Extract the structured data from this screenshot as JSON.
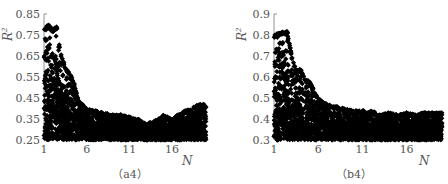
{
  "chart_data": [
    {
      "id": "a4",
      "type": "scatter",
      "title": "",
      "caption": "（a4）",
      "xlabel": "N",
      "ylabel": "R²",
      "xlim": [
        1,
        20
      ],
      "ylim": [
        0.25,
        0.85
      ],
      "xticks": [
        1,
        6,
        11,
        16
      ],
      "xtick_labels": [
        "1",
        "6",
        "11",
        "16"
      ],
      "yticks": [
        0.25,
        0.35,
        0.45,
        0.55,
        0.65,
        0.75,
        0.85
      ],
      "ytick_labels": [
        "0.25",
        "0.35",
        "0.45",
        "0.55",
        "0.65",
        "0.75",
        "0.85"
      ],
      "grid": false,
      "legend": null,
      "marker": "diamond",
      "color": "#000000",
      "upper_envelope": {
        "x": [
          1,
          1.5,
          2,
          2.5,
          3,
          3.5,
          4,
          4.5,
          5,
          6,
          7,
          8,
          9,
          10,
          11,
          12,
          13,
          14,
          15,
          16,
          17,
          18,
          19,
          20
        ],
        "y": [
          0.78,
          0.8,
          0.78,
          0.79,
          0.66,
          0.6,
          0.57,
          0.53,
          0.44,
          0.4,
          0.39,
          0.38,
          0.37,
          0.37,
          0.36,
          0.35,
          0.33,
          0.34,
          0.37,
          0.35,
          0.38,
          0.4,
          0.42,
          0.42
        ]
      },
      "lower_bound": 0.25
    },
    {
      "id": "b4",
      "type": "scatter",
      "title": "",
      "caption": "（b4）",
      "xlabel": "N",
      "ylabel": "R²",
      "xlim": [
        1,
        20
      ],
      "ylim": [
        0.3,
        0.9
      ],
      "xticks": [
        1,
        6,
        11,
        16
      ],
      "xtick_labels": [
        "1",
        "6",
        "11",
        "16"
      ],
      "yticks": [
        0.3,
        0.4,
        0.5,
        0.6,
        0.7,
        0.8,
        0.9
      ],
      "ytick_labels": [
        "0.3",
        "0.4",
        "0.5",
        "0.6",
        "0.7",
        "0.8",
        "0.9"
      ],
      "grid": false,
      "legend": null,
      "marker": "diamond",
      "color": "#000000",
      "upper_envelope": {
        "x": [
          1,
          1.5,
          2,
          2.5,
          3,
          3.5,
          4,
          4.5,
          5,
          6,
          7,
          8,
          9,
          10,
          11,
          12,
          13,
          14,
          15,
          16,
          17,
          18,
          19,
          20
        ],
        "y": [
          0.8,
          0.81,
          0.82,
          0.82,
          0.7,
          0.63,
          0.64,
          0.59,
          0.58,
          0.5,
          0.47,
          0.46,
          0.45,
          0.44,
          0.44,
          0.44,
          0.42,
          0.43,
          0.42,
          0.43,
          0.42,
          0.43,
          0.43,
          0.43
        ]
      },
      "lower_bound": 0.3
    }
  ]
}
